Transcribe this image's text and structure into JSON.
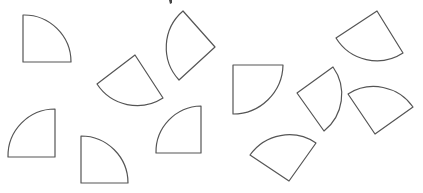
{
  "diagram": {
    "title": "",
    "stroke_color": "#555555",
    "fill_color": "#ffffff",
    "background_color": "#ffffff",
    "shape_count": 11,
    "shapes": [
      {
        "id": 1,
        "type": "quarter-circle-sector",
        "d": "M23,62 L23,15 A47,47 0 0 1 71,62 Z"
      },
      {
        "id": 2,
        "type": "quarter-circle-sector",
        "d": "M135,55 L163,98 A48,48 0 0 1 97,84 Z"
      },
      {
        "id": 3,
        "type": "quarter-circle-sector",
        "d": "M215,47 L179,80 A48,48 0 0 1 183,11 Z"
      },
      {
        "id": 4,
        "type": "quarter-circle-sector",
        "d": "M233,65 L283,65 A50,50 0 0 1 233,114 Z"
      },
      {
        "id": 5,
        "type": "quarter-circle-sector",
        "d": "M297,93 L333,67 A47,47 0 0 1 324,131 Z"
      },
      {
        "id": 6,
        "type": "quarter-circle-sector",
        "d": "M336,38 L377,11 L403,53 A48,48 0 0 1 336,38 Z"
      },
      {
        "id": 7,
        "type": "quarter-circle-sector",
        "d": "M375,134 L348,94 A48,48 0 0 1 413,107 Z"
      },
      {
        "id": 8,
        "type": "quarter-circle-sector",
        "d": "M289,181 L250,155 A48,48 0 0 1 316,143 Z"
      },
      {
        "id": 9,
        "type": "quarter-circle-sector",
        "d": "M55,157 L8,157 A47,47 0 0 1 55,109 Z"
      },
      {
        "id": 10,
        "type": "quarter-circle-sector",
        "d": "M81,183 L81,136 A47,47 0 0 1 128,183 Z"
      },
      {
        "id": 11,
        "type": "quarter-circle-sector",
        "d": "M201,153 L156,153 A46,46 0 0 1 201,106 Z"
      }
    ]
  }
}
